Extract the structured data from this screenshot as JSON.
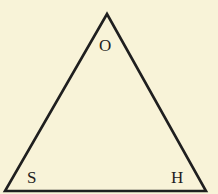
{
  "diagram": {
    "type": "triangle",
    "background_color": "#f8f3d8",
    "stroke_color": "#1f1f1f",
    "vertices": [
      {
        "id": "top",
        "label": "O",
        "x": 107,
        "y": 14
      },
      {
        "id": "bottom-left",
        "label": "S",
        "x": 5,
        "y": 191
      },
      {
        "id": "bottom-right",
        "label": "H",
        "x": 206,
        "y": 191
      }
    ],
    "labels": {
      "top": "O",
      "bottom_left": "S",
      "bottom_right": "H"
    }
  }
}
